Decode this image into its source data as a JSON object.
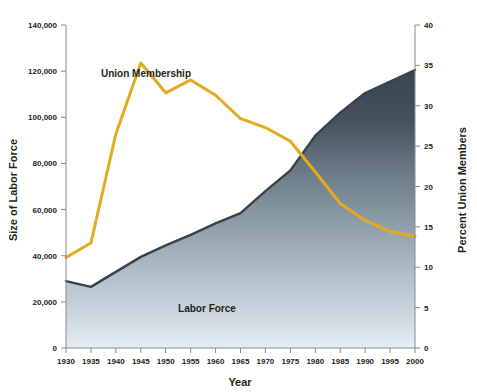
{
  "chart_data": {
    "type": "area",
    "title": "",
    "xlabel": "Year",
    "ylabel": "Size of Labor Force",
    "y2label": "Percent Union Members",
    "x": [
      1930,
      1935,
      1940,
      1945,
      1950,
      1955,
      1960,
      1965,
      1970,
      1975,
      1980,
      1985,
      1990,
      1995,
      2000
    ],
    "xtick_labels": [
      "1930",
      "1935",
      "1940",
      "1945",
      "1950",
      "1955",
      "1960",
      "1965",
      "1970",
      "1975",
      "1980",
      "1985",
      "1990",
      "1995",
      "2000"
    ],
    "xlim": [
      1930,
      2000
    ],
    "ylim": [
      0,
      140000
    ],
    "ytick_labels": [
      "0",
      "20,000",
      "40,000",
      "60,000",
      "80,000",
      "100,000",
      "120,000",
      "140,000"
    ],
    "ytick_values": [
      0,
      20000,
      40000,
      60000,
      80000,
      100000,
      120000,
      140000
    ],
    "y2lim": [
      0,
      40
    ],
    "y2tick_labels": [
      "0",
      "5",
      "10",
      "15",
      "20",
      "25",
      "30",
      "35",
      "40"
    ],
    "y2tick_values": [
      0,
      5,
      10,
      15,
      20,
      25,
      30,
      35,
      40
    ],
    "grid": false,
    "legend_position": "inline-annotations",
    "series": [
      {
        "name": "Labor Force",
        "type": "area",
        "axis": "left",
        "units": "thousands of workers",
        "color": "#38434f",
        "fill": "gradient dark slate to pale blue-gray",
        "label_text": "Labor Force",
        "values": [
          29000,
          26500,
          33000,
          39500,
          44500,
          49000,
          54000,
          58500,
          68000,
          77000,
          92000,
          102000,
          110500,
          115500,
          120500
        ]
      },
      {
        "name": "Union Membership",
        "type": "line",
        "axis": "right",
        "units": "percent of labor force",
        "color": "#e3aa1e",
        "label_text": "Union Membership",
        "values": [
          11.2,
          13.0,
          26.5,
          35.3,
          31.6,
          33.2,
          31.3,
          28.4,
          27.3,
          25.6,
          21.8,
          17.9,
          15.8,
          14.4,
          13.8
        ]
      }
    ]
  },
  "annotations": {
    "union_membership_label": "Union Membership",
    "labor_force_label": "Labor Force"
  },
  "colors": {
    "union_line": "#e3aa1e",
    "labor_force_stroke": "#38434f",
    "labor_force_fill_top": "#3c4855",
    "labor_force_fill_bottom": "#dde6ec",
    "axis": "#8a8a8a",
    "text": "#231f20"
  }
}
